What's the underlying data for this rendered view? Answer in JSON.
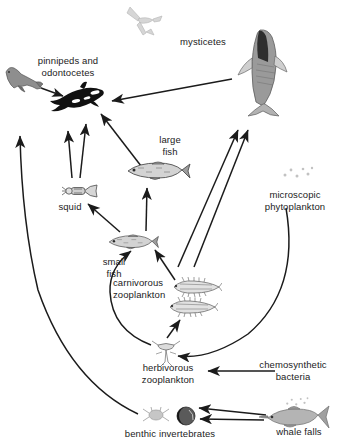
{
  "diagram": {
    "background_color": "#ffffff",
    "line_color": "#1b1b1b"
  },
  "nodes": [
    {
      "id": "seabird",
      "label": "",
      "label_x": 0,
      "label_y": 0,
      "art_x": 124,
      "art_y": 4,
      "art_w": 42,
      "art_h": 34,
      "art": "seabird-flying",
      "color": "#d8d8d8"
    },
    {
      "id": "pinnipeds",
      "label": "pinnipeds and\nodontocetes",
      "label_x": 18,
      "label_y": 55,
      "art_x": 2,
      "art_y": 62,
      "art_w": 42,
      "art_h": 36,
      "art": "seal",
      "color": "#8e8e8e"
    },
    {
      "id": "odontocetes",
      "label": "",
      "label_x": 0,
      "label_y": 0,
      "art_x": 46,
      "art_y": 80,
      "art_w": 60,
      "art_h": 36,
      "art": "orca",
      "color": "#111111"
    },
    {
      "id": "mysticetes",
      "label": "mysticetes",
      "label_x": 172,
      "label_y": 36,
      "art_x": 230,
      "art_y": 28,
      "art_w": 58,
      "art_h": 90,
      "art": "baleen-whale",
      "color": "#9a9a9a"
    },
    {
      "id": "large-fish",
      "label": "large\nfish",
      "label_x": 150,
      "label_y": 134,
      "art_x": 124,
      "art_y": 160,
      "art_w": 68,
      "art_h": 22,
      "art": "fish",
      "color": "#9b9b9b"
    },
    {
      "id": "squid",
      "label": "squid",
      "label_x": 52,
      "label_y": 201,
      "art_x": 62,
      "art_y": 181,
      "art_w": 38,
      "art_h": 20,
      "art": "squid",
      "color": "#9b9b9b"
    },
    {
      "id": "small-fish",
      "label": "small\nfish",
      "label_x": 95,
      "label_y": 256,
      "art_x": 106,
      "art_y": 233,
      "art_w": 54,
      "art_h": 18,
      "art": "fish",
      "color": "#9b9b9b"
    },
    {
      "id": "carn-zoop",
      "label": "carnivorous\nzooplankton",
      "label_x": 113,
      "label_y": 277,
      "art_x": 170,
      "art_y": 276,
      "art_w": 52,
      "art_h": 44,
      "art": "krill-pair",
      "color": "#8e8e8e"
    },
    {
      "id": "herb-zoop",
      "label": "herbivorous\nzooplankton",
      "label_x": 133,
      "label_y": 362,
      "art_x": 152,
      "art_y": 340,
      "art_w": 28,
      "art_h": 26,
      "art": "copepod",
      "color": "#9b9b9b"
    },
    {
      "id": "phytoplankton",
      "label": "microscopic\nphytoplankton",
      "label_x": 252,
      "label_y": 189,
      "art_x": 282,
      "art_y": 165,
      "art_w": 32,
      "art_h": 16,
      "art": "dots",
      "color": "#c2c2c2"
    },
    {
      "id": "chemo-bacteria",
      "label": "chemosynthetic\nbacteria",
      "label_x": 248,
      "label_y": 359,
      "art_x": 282,
      "art_y": 396,
      "art_w": 30,
      "art_h": 12,
      "art": "dots",
      "color": "#c9c9c9"
    },
    {
      "id": "benthic",
      "label": "benthic invertebrates",
      "label_x": 108,
      "label_y": 428,
      "art_x": 142,
      "art_y": 406,
      "art_w": 28,
      "art_h": 18,
      "art": "benthic-crab",
      "color": "#bcbcbc"
    },
    {
      "id": "whale-falls",
      "label": "whale falls",
      "label_x": 268,
      "label_y": 426,
      "art_x": 258,
      "art_y": 404,
      "art_w": 72,
      "art_h": 26,
      "art": "dead-whale",
      "color": "#a8a8a8"
    },
    {
      "id": "whale-carcass",
      "label": "",
      "label_x": 0,
      "label_y": 0,
      "art_x": 176,
      "art_y": 406,
      "art_w": 20,
      "art_h": 20,
      "art": "carcass-ball",
      "color": "#4a4a4a"
    }
  ],
  "edges": [
    {
      "from": "mysticetes",
      "to": "odontocetes",
      "note": "mysticetes to orca"
    },
    {
      "from": "pinnipeds",
      "to": "odontocetes",
      "note": "seal to orca"
    },
    {
      "from": "large-fish",
      "to": "odontocetes",
      "note": "large fish to orca"
    },
    {
      "from": "squid",
      "to": "pinnipeds",
      "note": "squid up to seal region"
    },
    {
      "from": "squid",
      "to": "odontocetes",
      "note": "squid to orca"
    },
    {
      "from": "small-fish",
      "to": "squid",
      "note": "small fish to squid"
    },
    {
      "from": "small-fish",
      "to": "large-fish",
      "note": "small fish to large fish"
    },
    {
      "from": "carn-zoop",
      "to": "small-fish",
      "note": "carnivorous zooplankton to small fish"
    },
    {
      "from": "herb-zoop",
      "to": "carn-zoop",
      "note": "herbivorous to carnivorous zooplankton"
    },
    {
      "from": "herb-zoop",
      "to": "small-fish",
      "note": "herbivorous zooplankton curve to small fish"
    },
    {
      "from": "herb-zoop",
      "to": "mysticetes",
      "note": "herbivorous zooplankton to baleen whale"
    },
    {
      "from": "carn-zoop",
      "to": "mysticetes",
      "note": "carnivorous zooplankton to baleen whale"
    },
    {
      "from": "phytoplankton",
      "to": "herb-zoop",
      "note": "phytoplankton curve down to herbivorous zooplankton"
    },
    {
      "from": "chemo-bacteria",
      "to": "herb-zoop",
      "note": "chemosynthetic bacteria to herbivorous zooplankton label"
    },
    {
      "from": "whale-falls",
      "to": "benthic",
      "note": "whale falls to benthic invertebrates"
    },
    {
      "from": "whale-falls",
      "to": "whale-carcass",
      "note": "whale falls to carcass"
    },
    {
      "from": "benthic",
      "to": "pinnipeds",
      "note": "long curve benthic up to seal"
    }
  ]
}
